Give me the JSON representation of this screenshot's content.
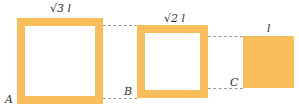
{
  "diagram": {
    "squares": [
      {
        "id": "large",
        "label": "√3 l",
        "type": "hollow"
      },
      {
        "id": "medium",
        "label": "√2 l",
        "type": "hollow"
      },
      {
        "id": "small",
        "label": "l",
        "type": "solid"
      }
    ],
    "points": {
      "A": "A",
      "B": "B",
      "C": "C"
    },
    "colors": {
      "fill": "#F8BE5C",
      "dash": "#9a9a9a"
    }
  }
}
